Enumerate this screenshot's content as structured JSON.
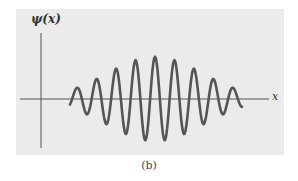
{
  "figure": {
    "y_axis_label": "ψ(x)",
    "x_axis_label": "x",
    "caption": "(b)"
  },
  "colors": {
    "panel_background": "#ebebeb",
    "curve": "#555555",
    "axis": "#555555"
  },
  "wave_packet": {
    "description": "Gaussian-modulated sinusoidal wave packet",
    "x_start_px": 70,
    "x_end_px": 242,
    "center_px": 155,
    "baseline_y_px": 99,
    "max_amplitude_px": 42,
    "wavelength_px": 19.5,
    "gaussian_sigma_px": 48,
    "visible_crests": 9
  }
}
